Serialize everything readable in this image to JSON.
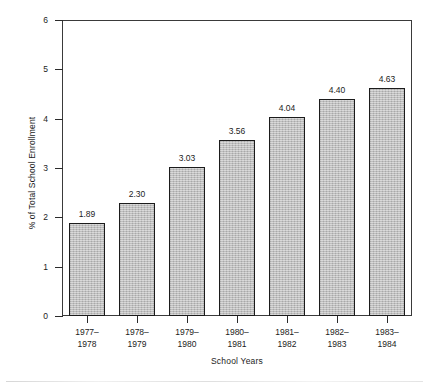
{
  "chart_data": {
    "type": "bar",
    "title": "",
    "subtitle": "",
    "xlabel": "School Years",
    "ylabel": "% of Total School Enrollment",
    "categories": [
      "1977–\n1978",
      "1978–\n1979",
      "1979–\n1980",
      "1980–\n1981",
      "1981–\n1982",
      "1982–\n1983",
      "1983–\n1984"
    ],
    "category_lines": [
      [
        "1977–",
        "1978"
      ],
      [
        "1978–",
        "1979"
      ],
      [
        "1979–",
        "1980"
      ],
      [
        "1980–",
        "1981"
      ],
      [
        "1981–",
        "1982"
      ],
      [
        "1982–",
        "1983"
      ],
      [
        "1983–",
        "1984"
      ]
    ],
    "values": [
      1.89,
      2.3,
      3.03,
      3.56,
      4.04,
      4.4,
      4.63
    ],
    "value_labels": [
      "1.89",
      "2.30",
      "3.03",
      "3.56",
      "4.04",
      "4.40",
      "4.63"
    ],
    "ylim": [
      0,
      6
    ],
    "yticks": [
      0,
      1,
      2,
      3,
      4,
      5,
      6
    ],
    "ytick_labels": [
      "0",
      "1",
      "2",
      "3",
      "4",
      "5",
      "6"
    ],
    "grid": false,
    "legend": false,
    "legend_position": "none",
    "bar_fill_color": "#b9b9b9",
    "bar_border_color": "#1b1b1b",
    "axis_color": "#2b2b2b",
    "background_color": "#ffffff",
    "text_color": "#1c1c1c"
  }
}
